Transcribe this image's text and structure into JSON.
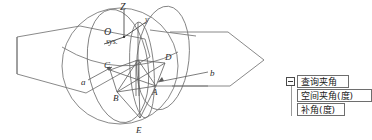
{
  "figure": {
    "title_hidden": "",
    "axis_labels": {
      "z": "Z",
      "y": "y",
      "origin": "O",
      "origin_sub": "sys."
    },
    "point_labels": [
      {
        "id": "A",
        "text": "A"
      },
      {
        "id": "B",
        "text": "B"
      },
      {
        "id": "C",
        "text": "C"
      },
      {
        "id": "D",
        "text": "D"
      },
      {
        "id": "E",
        "text": "E"
      },
      {
        "id": "a",
        "text": "a"
      },
      {
        "id": "b",
        "text": "b"
      }
    ],
    "line_color": "#6b6b6b",
    "label_color": "#2b2b2b",
    "background": "#ffffff"
  },
  "tree": {
    "expander_glyph": "minus",
    "root": {
      "label": "查询夹角"
    },
    "children": [
      {
        "label": "空间夹角(度)"
      },
      {
        "label": "补角(度)"
      }
    ]
  }
}
